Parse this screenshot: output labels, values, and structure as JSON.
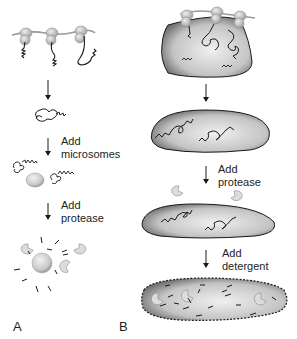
{
  "panels": [
    {
      "letter": "A",
      "steps": [
        {
          "label_line1": "Add",
          "label_line2": "microsomes"
        },
        {
          "label_line1": "Add",
          "label_line2": "protease"
        }
      ]
    },
    {
      "letter": "B",
      "steps": [
        {
          "label_line1": "Add",
          "label_line2": "protease"
        },
        {
          "label_line1": "Add",
          "label_line2": "detergent"
        }
      ]
    }
  ],
  "colors": {
    "ink": "#1a1a1a",
    "membrane_fill": "#bdbdbd",
    "membrane_light": "#e6e6e6",
    "ribosome": "#c9c9c9",
    "protease": "#d8d8d8"
  }
}
